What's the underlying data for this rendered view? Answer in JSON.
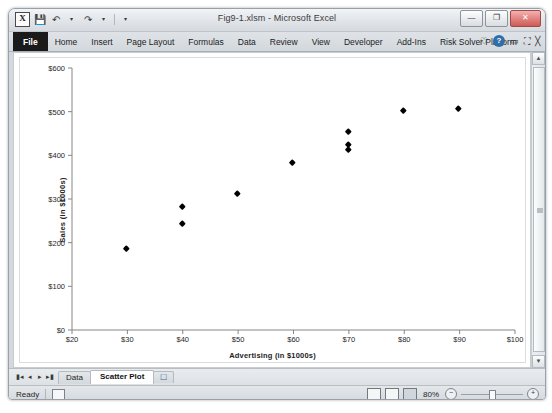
{
  "window": {
    "title": "Fig9-1.xlsm - Microsoft Excel",
    "app_icon": "excel-icon",
    "app_icon_glyph": "X",
    "quick_access": [
      {
        "name": "save-icon",
        "glyph": "Ὃe"
      },
      {
        "name": "undo-icon",
        "glyph": "↶"
      },
      {
        "name": "undo-dropdown-icon",
        "glyph": "▾"
      },
      {
        "name": "redo-icon",
        "glyph": "↷"
      },
      {
        "name": "redo-dropdown-icon",
        "glyph": "▾"
      },
      {
        "name": "customize-quick-access-icon",
        "glyph": "▾"
      }
    ],
    "controls": {
      "minimize": "—",
      "restore": "❐",
      "close": "✕"
    }
  },
  "ribbon": {
    "tabs": [
      {
        "label": "File",
        "type": "file"
      },
      {
        "label": "Home",
        "type": "normal"
      },
      {
        "label": "Insert",
        "type": "normal"
      },
      {
        "label": "Page Layout",
        "type": "normal"
      },
      {
        "label": "Formulas",
        "type": "normal"
      },
      {
        "label": "Data",
        "type": "normal"
      },
      {
        "label": "Review",
        "type": "normal"
      },
      {
        "label": "View",
        "type": "normal"
      },
      {
        "label": "Developer",
        "type": "normal"
      },
      {
        "label": "Add-Ins",
        "type": "normal"
      },
      {
        "label": "Risk Solver Platform",
        "type": "normal"
      }
    ],
    "right_icons": [
      {
        "name": "ribbon-options-icon",
        "glyph": "♡"
      },
      {
        "name": "help-icon",
        "glyph": "?"
      },
      {
        "name": "minimize-ribbon-icon",
        "glyph": "▭"
      },
      {
        "name": "restore-window-icon",
        "glyph": "❐"
      },
      {
        "name": "close-window-icon",
        "glyph": "✕"
      }
    ]
  },
  "scrollbar": {
    "up_arrow": "▲",
    "down_arrow": "▼"
  },
  "sheet_tabs": {
    "nav": [
      "⏮",
      "◀",
      "▶",
      "⏭"
    ],
    "tabs": [
      {
        "label": "Data",
        "active": false
      },
      {
        "label": "Scatter Plot",
        "active": true
      }
    ],
    "new_sheet_label": "➕"
  },
  "status_bar": {
    "mode": "Ready",
    "macro_icon": "record-macro-icon",
    "views": [
      {
        "name": "normal-view-button",
        "active": false
      },
      {
        "name": "page-layout-view-button",
        "active": false
      },
      {
        "name": "page-break-view-button",
        "active": true
      }
    ],
    "zoom_level": "80%",
    "zoom_out": "−",
    "zoom_in": "+"
  },
  "chart_data": {
    "type": "scatter",
    "title": "",
    "xlabel": "Advertising (in $1000s)",
    "ylabel": "Sales (in $1000s)",
    "xlim": [
      20,
      100
    ],
    "ylim": [
      0,
      600
    ],
    "xticks": [
      20,
      30,
      40,
      50,
      60,
      70,
      80,
      90,
      100
    ],
    "xtick_labels": [
      "$20",
      "$30",
      "$40",
      "$50",
      "$60",
      "$70",
      "$80",
      "$90",
      "$100"
    ],
    "yticks": [
      0,
      100,
      200,
      300,
      400,
      500,
      600
    ],
    "ytick_labels": [
      "$0",
      "$100",
      "$200",
      "$300",
      "$400",
      "$500",
      "$600"
    ],
    "grid": false,
    "legend": false,
    "marker": "diamond",
    "marker_color": "#000000",
    "series": [
      {
        "name": "Sales vs Advertising",
        "points": [
          {
            "x": 30,
            "y": 185
          },
          {
            "x": 40,
            "y": 281
          },
          {
            "x": 40,
            "y": 243
          },
          {
            "x": 50,
            "y": 310
          },
          {
            "x": 60,
            "y": 381
          },
          {
            "x": 70,
            "y": 453
          },
          {
            "x": 70,
            "y": 424
          },
          {
            "x": 70,
            "y": 411
          },
          {
            "x": 80,
            "y": 501
          },
          {
            "x": 90,
            "y": 506
          }
        ]
      }
    ]
  }
}
